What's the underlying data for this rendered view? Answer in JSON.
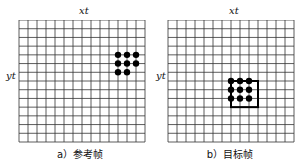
{
  "panels": [
    {
      "caption": "a）参考帧",
      "x_label": "xt",
      "y_label": "yt",
      "grid": {
        "cols": 14,
        "rows": 14
      },
      "dots": [
        [
          11,
          4
        ],
        [
          12,
          4
        ],
        [
          13,
          4
        ],
        [
          11,
          5
        ],
        [
          12,
          5
        ],
        [
          13,
          5
        ],
        [
          11,
          6
        ],
        [
          12,
          6
        ]
      ],
      "box": null
    },
    {
      "caption": "b）目标帧",
      "x_label": "xt",
      "y_label": "yt",
      "grid": {
        "cols": 14,
        "rows": 14
      },
      "dots": [
        [
          7,
          7
        ],
        [
          8,
          7
        ],
        [
          9,
          7
        ],
        [
          7,
          8
        ],
        [
          8,
          8
        ],
        [
          9,
          8
        ],
        [
          7,
          9
        ],
        [
          8,
          9
        ],
        [
          9,
          9
        ]
      ],
      "box": {
        "col": 7,
        "row": 7,
        "cols": 3,
        "rows": 3
      }
    }
  ]
}
